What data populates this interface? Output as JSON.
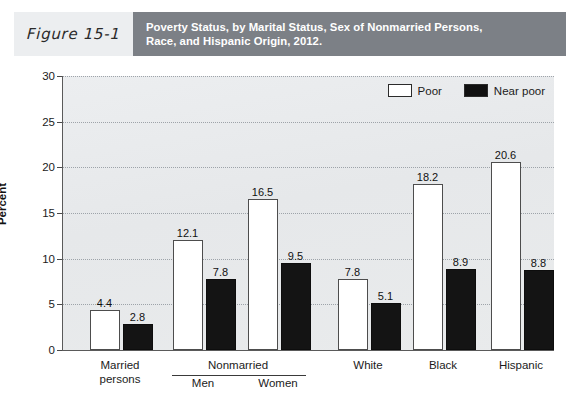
{
  "header": {
    "figure_number": "Figure 15-1",
    "title_line1": "Poverty Status, by Marital Status, Sex of Nonmarried Persons,",
    "title_line2": "Race, and Hispanic Origin, 2012.",
    "number_box_color": "#eceef0",
    "title_box_color": "#7c8086"
  },
  "legend": {
    "position": "top-right",
    "items": [
      {
        "label": "Poor",
        "color": "#ffffff"
      },
      {
        "label": "Near poor",
        "color": "#111111"
      }
    ]
  },
  "axis": {
    "y_title": "Percent",
    "y_ticks": [
      "0",
      "5",
      "10",
      "15",
      "20",
      "25",
      "30"
    ]
  },
  "x_groups": {
    "married_label_line1": "Married",
    "married_label_line2": "persons",
    "nonmarried_label": "Nonmarried",
    "men_label": "Men",
    "women_label": "Women",
    "white_label": "White",
    "black_label": "Black",
    "hispanic_label": "Hispanic"
  },
  "chart_data": {
    "type": "bar",
    "title": "Poverty Status, by Marital Status, Sex of Nonmarried Persons, Race, and Hispanic Origin, 2012.",
    "xlabel": "",
    "ylabel": "Percent",
    "ylim": [
      0,
      30
    ],
    "ytick_step": 5,
    "grid": true,
    "legend_position": "top-right",
    "categories": [
      "Married persons",
      "Men",
      "Women",
      "White",
      "Black",
      "Hispanic"
    ],
    "series": [
      {
        "name": "Poor",
        "color": "#ffffff",
        "values": [
          4.4,
          12.1,
          16.5,
          7.8,
          18.2,
          20.6
        ]
      },
      {
        "name": "Near poor",
        "color": "#111111",
        "values": [
          2.8,
          7.8,
          9.5,
          5.1,
          8.9,
          8.8
        ]
      }
    ],
    "annotations": {
      "nonmarried_bracket": "Nonmarried spans Men and Women"
    }
  }
}
